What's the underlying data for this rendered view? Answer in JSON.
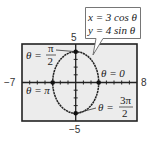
{
  "figure": {
    "type": "parametric-ellipse-graph",
    "window": {
      "xmin": -7,
      "xmax": 8,
      "ymin": -5,
      "ymax": 5
    },
    "axis_labels": {
      "xmin": "−7",
      "xmax": "8",
      "ymax": "5",
      "ymin": "−5"
    },
    "equations": {
      "line1": "x = 3 cos θ",
      "line2": "y = 4 sin θ"
    },
    "points": [
      {
        "name": "theta-pi-over-2",
        "label_left": "θ =",
        "numerator": "π",
        "denominator": "2",
        "x": 0,
        "y": 4
      },
      {
        "name": "theta-0",
        "label": "θ = 0",
        "x": 3,
        "y": 0
      },
      {
        "name": "theta-pi",
        "label": "θ = π",
        "x": -3,
        "y": 0
      },
      {
        "name": "theta-3pi-over-2",
        "label_left": "θ =",
        "numerator": "3π",
        "denominator": "2",
        "x": 0,
        "y": -4
      }
    ],
    "colors": {
      "screen_bg": "#ececec",
      "frame": "#222222",
      "curve": "#222222",
      "callout_bg": "#ffffff"
    }
  }
}
